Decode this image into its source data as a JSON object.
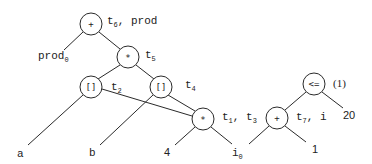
{
  "diagram": {
    "type": "expression-dag",
    "nodes": [
      {
        "id": "n_plus_top",
        "op": "+",
        "label": "t",
        "label_sub": "6",
        "label_rest": ", prod",
        "cx": 91,
        "cy": 24
      },
      {
        "id": "n_mul_t5",
        "op": "*",
        "label": "t",
        "label_sub": "5",
        "label_rest": "",
        "cx": 128,
        "cy": 57
      },
      {
        "id": "n_idx_t2",
        "op": "[]",
        "label": "t",
        "label_sub": "2",
        "label_rest": "",
        "cx": 91,
        "cy": 87
      },
      {
        "id": "n_idx_t4",
        "op": "[]",
        "label": "t",
        "label_sub": "4",
        "label_rest": "",
        "cx": 161,
        "cy": 87
      },
      {
        "id": "n_mul_t1t3",
        "op": "*",
        "label": "t",
        "label_sub": "1",
        "label_rest": ", t",
        "label_sub2": "3",
        "cx": 203,
        "cy": 119
      },
      {
        "id": "n_le",
        "op": "<=",
        "label": "(1)",
        "cx": 314,
        "cy": 84
      },
      {
        "id": "n_plus_t7",
        "op": "+",
        "label": "t",
        "label_sub": "7",
        "label_rest": ", i",
        "cx": 277,
        "cy": 118
      }
    ],
    "leaves": [
      {
        "id": "leaf_prod0",
        "text": "prod",
        "sub": "0"
      },
      {
        "id": "leaf_a",
        "text": "a"
      },
      {
        "id": "leaf_b",
        "text": "b"
      },
      {
        "id": "leaf_4",
        "text": "4"
      },
      {
        "id": "leaf_i0",
        "text": "i",
        "sub": "0"
      },
      {
        "id": "leaf_1",
        "text": "1"
      },
      {
        "id": "leaf_20",
        "text": "20"
      }
    ],
    "edges": [
      [
        "n_plus_top",
        "leaf_prod0"
      ],
      [
        "n_plus_top",
        "n_mul_t5"
      ],
      [
        "n_mul_t5",
        "n_idx_t2"
      ],
      [
        "n_mul_t5",
        "n_idx_t4"
      ],
      [
        "n_idx_t2",
        "leaf_a"
      ],
      [
        "n_idx_t2",
        "n_mul_t1t3"
      ],
      [
        "n_idx_t4",
        "leaf_b"
      ],
      [
        "n_idx_t4",
        "n_mul_t1t3"
      ],
      [
        "n_mul_t1t3",
        "leaf_4"
      ],
      [
        "n_mul_t1t3",
        "leaf_i0"
      ],
      [
        "n_le",
        "n_plus_t7"
      ],
      [
        "n_le",
        "leaf_20"
      ],
      [
        "n_plus_t7",
        "leaf_i0"
      ],
      [
        "n_plus_t7",
        "leaf_1"
      ]
    ]
  },
  "text": {
    "op_plus": "+",
    "op_mul": "*",
    "op_idx": "[]",
    "op_le": "<=",
    "t": "t",
    "sub_6": "6",
    "prod_suffix": ", prod",
    "sub_5": "5",
    "sub_2": "2",
    "sub_4": "4",
    "sub_1": "1",
    "comma_t": ", t",
    "sub_3": "3",
    "paren_1": "(1)",
    "sub_7": "7",
    "comma_i": ", i",
    "leaf_prod": "prod",
    "sub_0": "0",
    "leaf_a": "a",
    "leaf_b": "b",
    "leaf_4": "4",
    "leaf_i": "i",
    "leaf_1": "1",
    "leaf_20": "20"
  }
}
